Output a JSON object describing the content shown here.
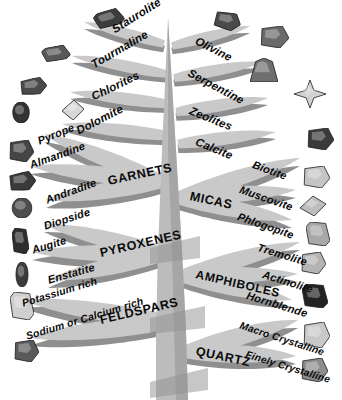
{
  "diagram": {
    "type": "tree-diagram",
    "background_color": "#ffffff",
    "branch_color": "#c9c9c9",
    "branch_shadow_color": "#8f8f8f",
    "trunk_color": "#bcbcbc",
    "trunk_shadow_color": "#949494",
    "label_color": "#0a0a0a"
  },
  "branches": {
    "left": [
      {
        "label": "Staurolite",
        "tier": 1,
        "side": "left",
        "x": 113,
        "y": 30,
        "rot": -32,
        "size": 11.5,
        "category": false
      },
      {
        "label": "Tourmaline",
        "tier": 2,
        "side": "left",
        "x": 92,
        "y": 65,
        "rot": -30,
        "size": 11.5,
        "category": false
      },
      {
        "label": "Chlorites",
        "tier": 3,
        "side": "left",
        "x": 92,
        "y": 97,
        "rot": -26,
        "size": 11.5,
        "category": false
      },
      {
        "label": "Dolomite",
        "tier": 4,
        "side": "left",
        "x": 77,
        "y": 131,
        "rot": -27,
        "size": 11.5,
        "category": false
      },
      {
        "label": "Pyrope",
        "tier": 5,
        "side": "left",
        "x": 38,
        "y": 141,
        "rot": -22,
        "size": 11.0,
        "category": false
      },
      {
        "label": "Almandine",
        "tier": 6,
        "side": "left",
        "x": 30,
        "y": 165,
        "rot": -20,
        "size": 11.0,
        "category": false
      },
      {
        "label": "Andradite",
        "tier": 7,
        "side": "left",
        "x": 46,
        "y": 200,
        "rot": -20,
        "size": 11.0,
        "category": false
      },
      {
        "label": "Diopside",
        "tier": 8,
        "side": "left",
        "x": 44,
        "y": 226,
        "rot": -18,
        "size": 11.0,
        "category": false
      },
      {
        "label": "Augite",
        "tier": 9,
        "side": "left",
        "x": 32,
        "y": 250,
        "rot": -17,
        "size": 11.0,
        "category": false
      },
      {
        "label": "Enstatite",
        "tier": 10,
        "side": "left",
        "x": 48,
        "y": 280,
        "rot": -16,
        "size": 11.0,
        "category": false
      },
      {
        "label": "Potassium rich",
        "tier": 11,
        "side": "left",
        "x": 22,
        "y": 303,
        "rot": -17,
        "size": 10.5,
        "category": false
      },
      {
        "label": "Sodium or Calcium rich",
        "tier": 12,
        "side": "left",
        "x": 26,
        "y": 336,
        "rot": -17,
        "size": 10.5,
        "category": false
      }
    ],
    "right": [
      {
        "label": "Olivine",
        "tier": 1,
        "side": "right",
        "x": 196,
        "y": 40,
        "rot": 27,
        "size": 11.5,
        "category": false
      },
      {
        "label": "Serpentine",
        "tier": 2,
        "side": "right",
        "x": 189,
        "y": 72,
        "rot": 28,
        "size": 11.5,
        "category": false
      },
      {
        "label": "Zeolites",
        "tier": 3,
        "side": "right",
        "x": 190,
        "y": 110,
        "rot": 22,
        "size": 11.5,
        "category": false
      },
      {
        "label": "Calcite",
        "tier": 4,
        "side": "right",
        "x": 196,
        "y": 141,
        "rot": 22,
        "size": 11.5,
        "category": false
      },
      {
        "label": "Biotite",
        "tier": 5,
        "side": "right",
        "x": 253,
        "y": 164,
        "rot": 20,
        "size": 11.0,
        "category": false
      },
      {
        "label": "Muscovite",
        "tier": 6,
        "side": "right",
        "x": 240,
        "y": 189,
        "rot": 19,
        "size": 11.0,
        "category": false
      },
      {
        "label": "Phlogopite",
        "tier": 7,
        "side": "right",
        "x": 238,
        "y": 216,
        "rot": 19,
        "size": 11.0,
        "category": false
      },
      {
        "label": "Tremolite",
        "tier": 8,
        "side": "right",
        "x": 258,
        "y": 247,
        "rot": 17,
        "size": 11.0,
        "category": false
      },
      {
        "label": "Actinolite",
        "tier": 9,
        "side": "right",
        "x": 263,
        "y": 274,
        "rot": 17,
        "size": 11.0,
        "category": false
      },
      {
        "label": "Hornblende",
        "tier": 10,
        "side": "right",
        "x": 247,
        "y": 295,
        "rot": 17,
        "size": 11.0,
        "category": false
      },
      {
        "label": "Macro Crystalline",
        "tier": 11,
        "side": "right",
        "x": 240,
        "y": 325,
        "rot": 18,
        "size": 10.2,
        "category": false
      },
      {
        "label": "Finely Crystalline",
        "tier": 12,
        "side": "right",
        "x": 246,
        "y": 354,
        "rot": 17,
        "size": 10.2,
        "category": false
      }
    ]
  },
  "categories": [
    {
      "label": "GARNETS",
      "x": 108,
      "y": 181,
      "rot": -12,
      "size": 12.5
    },
    {
      "label": "MICAS",
      "x": 190,
      "y": 196,
      "rot": 12,
      "size": 12.5
    },
    {
      "label": "PYROXENES",
      "x": 100,
      "y": 253,
      "rot": -13,
      "size": 12.5
    },
    {
      "label": "AMPHIBOLES",
      "x": 196,
      "y": 274,
      "rot": 13,
      "size": 12.0
    },
    {
      "label": "FELDSPARS",
      "x": 100,
      "y": 320,
      "rot": -13,
      "size": 12.5
    },
    {
      "label": "QUARTZ",
      "x": 196,
      "y": 351,
      "rot": 12,
      "size": 12.5
    }
  ],
  "specimens": {
    "left": [
      {
        "name": "specimen-staurolite",
        "x": 94,
        "y": 10,
        "w": 30,
        "h": 17,
        "rot": -18,
        "tone": "#3c3c3c",
        "shape": "prism"
      },
      {
        "name": "specimen-tourmaline",
        "x": 42,
        "y": 46,
        "w": 28,
        "h": 15,
        "rot": -12,
        "tone": "#585858",
        "shape": "prism"
      },
      {
        "name": "specimen-chlorites",
        "x": 19,
        "y": 78,
        "w": 28,
        "h": 17,
        "rot": -8,
        "tone": "#4a4a4a",
        "shape": "blocky"
      },
      {
        "name": "specimen-dolomite",
        "x": 62,
        "y": 100,
        "w": 22,
        "h": 20,
        "rot": 6,
        "tone": "#d8d8d8",
        "shape": "rhomb"
      },
      {
        "name": "specimen-pyrope",
        "x": 10,
        "y": 102,
        "w": 22,
        "h": 21,
        "rot": 0,
        "tone": "#333333",
        "shape": "round"
      },
      {
        "name": "specimen-almandine",
        "x": 8,
        "y": 140,
        "w": 26,
        "h": 22,
        "rot": 0,
        "tone": "#454545",
        "shape": "blocky"
      },
      {
        "name": "specimen-andradite",
        "x": 8,
        "y": 172,
        "w": 28,
        "h": 19,
        "rot": -8,
        "tone": "#3a3a3a",
        "shape": "blocky"
      },
      {
        "name": "specimen-diopside",
        "x": 9,
        "y": 198,
        "w": 26,
        "h": 20,
        "rot": 0,
        "tone": "#4e4e4e",
        "shape": "round"
      },
      {
        "name": "specimen-augite",
        "x": 12,
        "y": 228,
        "w": 17,
        "h": 26,
        "rot": 0,
        "tone": "#2e2e2e",
        "shape": "prism"
      },
      {
        "name": "specimen-enstatite",
        "x": 14,
        "y": 262,
        "w": 16,
        "h": 25,
        "rot": 0,
        "tone": "#3c3c3c",
        "shape": "round"
      },
      {
        "name": "specimen-potassium-feldspar",
        "x": 10,
        "y": 292,
        "w": 24,
        "h": 28,
        "rot": 0,
        "tone": "#cfcfcf",
        "shape": "prism"
      },
      {
        "name": "specimen-plagioclase",
        "x": 13,
        "y": 340,
        "w": 26,
        "h": 22,
        "rot": 0,
        "tone": "#5a5a5a",
        "shape": "blocky"
      }
    ],
    "right": [
      {
        "name": "specimen-olivine",
        "x": 213,
        "y": 12,
        "w": 28,
        "h": 18,
        "rot": 12,
        "tone": "#4a4a4a",
        "shape": "blocky"
      },
      {
        "name": "specimen-serpentine",
        "x": 259,
        "y": 26,
        "w": 30,
        "h": 22,
        "rot": 0,
        "tone": "#6a6a6a",
        "shape": "blocky"
      },
      {
        "name": "specimen-zeolite",
        "x": 250,
        "y": 58,
        "w": 28,
        "h": 24,
        "rot": 0,
        "tone": "#6f6f6f",
        "shape": "fan"
      },
      {
        "name": "specimen-calcite",
        "x": 294,
        "y": 80,
        "w": 32,
        "h": 28,
        "rot": 0,
        "tone": "#d2d2d2",
        "shape": "star"
      },
      {
        "name": "specimen-biotite",
        "x": 306,
        "y": 128,
        "w": 28,
        "h": 22,
        "rot": 0,
        "tone": "#3a3a3a",
        "shape": "blocky"
      },
      {
        "name": "specimen-muscovite",
        "x": 302,
        "y": 166,
        "w": 28,
        "h": 22,
        "rot": 0,
        "tone": "#c4c4c4",
        "shape": "blocky"
      },
      {
        "name": "specimen-phlogopite",
        "x": 300,
        "y": 196,
        "w": 26,
        "h": 20,
        "rot": 0,
        "tone": "#bdbdbd",
        "shape": "rhomb"
      },
      {
        "name": "specimen-tremolite",
        "x": 306,
        "y": 222,
        "w": 24,
        "h": 24,
        "rot": 0,
        "tone": "#a8a8a8",
        "shape": "prism"
      },
      {
        "name": "specimen-actinolite",
        "x": 300,
        "y": 252,
        "w": 26,
        "h": 22,
        "rot": 0,
        "tone": "#b4b4b4",
        "shape": "blocky"
      },
      {
        "name": "specimen-hornblende",
        "x": 302,
        "y": 284,
        "w": 26,
        "h": 24,
        "rot": 0,
        "tone": "#232323",
        "shape": "prism"
      },
      {
        "name": "specimen-macro-quartz",
        "x": 302,
        "y": 322,
        "w": 28,
        "h": 26,
        "rot": 0,
        "tone": "#c8c8c8",
        "shape": "blocky"
      },
      {
        "name": "specimen-fine-quartz",
        "x": 300,
        "y": 358,
        "w": 28,
        "h": 24,
        "rot": 0,
        "tone": "#8c8c8c",
        "shape": "blocky"
      }
    ]
  }
}
